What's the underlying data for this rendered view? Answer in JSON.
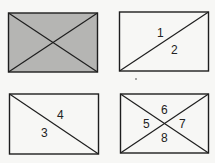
{
  "diagram": {
    "panels": [
      {
        "id": "panel-top-left",
        "fill": "#b5b5b3",
        "diagonals": [
          "tl-br",
          "bl-tr"
        ],
        "labels": []
      },
      {
        "id": "panel-top-right",
        "fill": "none",
        "diagonals": [
          "bl-tr"
        ],
        "labels": [
          "1",
          "2"
        ]
      },
      {
        "id": "panel-bottom-left",
        "fill": "none",
        "diagonals": [
          "tl-br"
        ],
        "labels": [
          "4",
          "3"
        ]
      },
      {
        "id": "panel-bottom-right",
        "fill": "none",
        "diagonals": [
          "tl-br",
          "bl-tr"
        ],
        "labels": [
          "6",
          "5",
          "7",
          "8"
        ]
      }
    ],
    "stroke_color": "#1e1e1e",
    "shade_color": "#b5b5b3"
  }
}
